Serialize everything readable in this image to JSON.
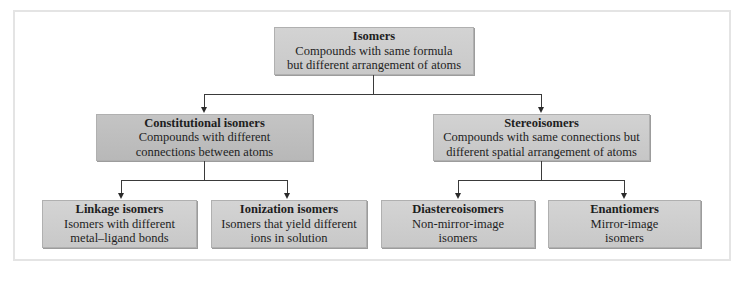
{
  "diagram": {
    "root": {
      "title": "Isomers",
      "description": "Compounds with same formula\nbut different arrangement of atoms"
    },
    "branches": [
      {
        "title": "Constitutional isomers",
        "description": "Compounds with different\nconnections between atoms",
        "children": [
          {
            "title": "Linkage isomers",
            "description": "Isomers with different\nmetal–ligand bonds"
          },
          {
            "title": "Ionization isomers",
            "description": "Isomers that yield different\nions in solution"
          }
        ]
      },
      {
        "title": "Stereoisomers",
        "description": "Compounds with same connections but\ndifferent spatial arrangement of atoms",
        "children": [
          {
            "title": "Diastereoisomers",
            "description": "Non-mirror-image\nisomers"
          },
          {
            "title": "Enantiomers",
            "description": "Mirror-image\nisomers"
          }
        ]
      }
    ],
    "colors": {
      "box_fill": "#cccccc",
      "box_fill_dark": "#bdbdbd",
      "connector": "#3a3a3a",
      "frame_border": "#e4e4e4"
    }
  }
}
